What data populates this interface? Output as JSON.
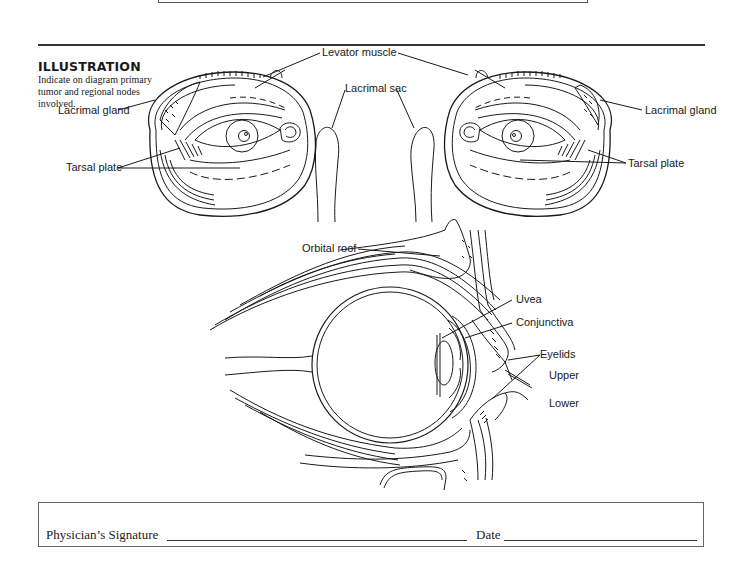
{
  "section": {
    "heading": "ILLUSTRATION",
    "caption": "Indicate on diagram primary tumor and regional nodes involved."
  },
  "front_view": {
    "labels": {
      "levator_muscle": "Levator muscle",
      "lacrimal_gland_left": "Lacrimal  gland",
      "lacrimal_sac": "Lacrimal sac",
      "lacrimal_gland_right": "Lacrimal gland",
      "tarsal_plate_left": "Tarsal plate",
      "tarsal_plate_right": "Tarsal plate"
    }
  },
  "side_view": {
    "labels": {
      "orbital_roof": "Orbital roof",
      "uvea": "Uvea",
      "conjunctiva": "Conjunctiva",
      "eyelids": "Eyelids",
      "upper": "Upper",
      "lower": "Lower"
    }
  },
  "signature": {
    "physician_label": "Physician’s Signature",
    "physician_value": "",
    "date_label": "Date",
    "date_value": ""
  }
}
